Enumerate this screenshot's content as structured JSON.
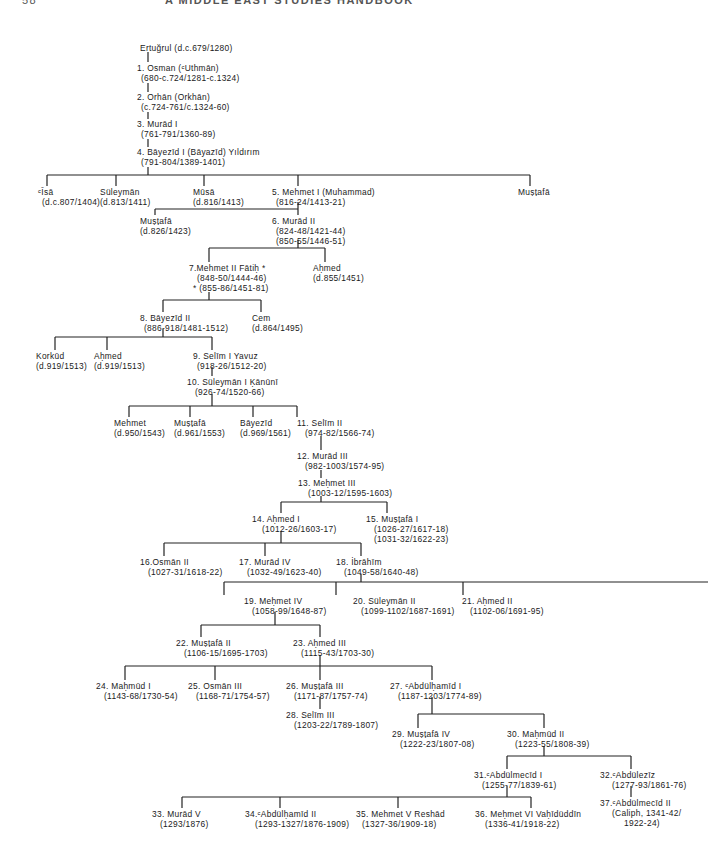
{
  "page": {
    "number": "58",
    "running_title": "A MIDDLE EAST STUDIES HANDBOOK"
  },
  "diagram_title": "Ottoman dynasty genealogy",
  "nodes": {
    "ertugrul": {
      "name": "Ertuğrul (d.c.679/1280)"
    },
    "n1": {
      "name": "1. Osman (ᶜUthmān)",
      "dates": "(680-c.724/1281-c.1324)"
    },
    "n2": {
      "name": "2. Orhān (Orkhān)",
      "dates": "(c.724-761/c.1324-60)"
    },
    "n3": {
      "name": "3. Murād I",
      "dates": "(761-791/1360-89)"
    },
    "n4": {
      "name": "4. Bāyezīd I (Bāyazīd) Yıldırım",
      "dates": "(791-804/1389-1401)"
    },
    "isa": {
      "name": "ᶜĪsā",
      "dates": "(d.c.807/1404)"
    },
    "suleyman_a": {
      "name": "Süleymān",
      "dates": "(d.813/1411)"
    },
    "musa": {
      "name": "Mūsā",
      "dates": "(d.816/1413)"
    },
    "n5": {
      "name": "5. Mehmet I (Muhammad)",
      "dates": "(816-24/1413-21)"
    },
    "mustafa_a": {
      "name": "Muṣṭafā"
    },
    "mustafa_b": {
      "name": "Muṣṭafā",
      "dates": "(d.826/1423)"
    },
    "n6": {
      "name": "6. Murād II",
      "dates": "(824-48/1421-44)",
      "dates2": "(850-55/1446-51)"
    },
    "n7": {
      "name": "7.Mehmet II Fātiḥ *",
      "dates": "(848-50/1444-46)",
      "dates2": "* (855-86/1451-81)"
    },
    "ahmed_a": {
      "name": "Aḥmed",
      "dates": "(d.855/1451)"
    },
    "n8": {
      "name": "8. Bāyezīd II",
      "dates": "(886-918/1481-1512)"
    },
    "cem": {
      "name": "Cem",
      "dates": "(d.864/1495)"
    },
    "korkud": {
      "name": "Korkūd",
      "dates": "(d.919/1513)"
    },
    "ahmed_b": {
      "name": "Aḥmed",
      "dates": "(d.919/1513)"
    },
    "n9": {
      "name": "9. Selīm I Yavuz",
      "dates": "(918-26/1512-20)"
    },
    "n10": {
      "name": "10. Süleymān I Ḳānūnī",
      "dates": "(926-74/1520-66)"
    },
    "mehmet_a": {
      "name": "Mehmet",
      "dates": "(d.950/1543)"
    },
    "mustafa_c": {
      "name": "Muṣṭafā",
      "dates": "(d.961/1553)"
    },
    "bayezid_a": {
      "name": "Bāyezīd",
      "dates": "(d.969/1561)"
    },
    "n11": {
      "name": "11. Selīm II",
      "dates": "(974-82/1566-74)"
    },
    "n12": {
      "name": "12. Murād III",
      "dates": "(982-1003/1574-95)"
    },
    "n13": {
      "name": "13. Meḥmet III",
      "dates": "(1003-12/1595-1603)"
    },
    "n14": {
      "name": "14. Aḥmed I",
      "dates": "(1012-26/1603-17)"
    },
    "n15": {
      "name": "15. Muṣṭafā I",
      "dates": "(1026-27/1617-18)",
      "dates2": "(1031-32/1622-23)"
    },
    "n16": {
      "name": "16.Osmān II",
      "dates": "(1027-31/1618-22)"
    },
    "n17": {
      "name": "17. Murād IV",
      "dates": "(1032-49/1623-40)"
    },
    "n18": {
      "name": "18. İbrāhīm",
      "dates": "(1049-58/1640-48)"
    },
    "n19": {
      "name": "19. Meḥmet IV",
      "dates": "(1058-99/1648-87)"
    },
    "n20": {
      "name": "20. Süleymān II",
      "dates": "(1099-1102/1687-1691)"
    },
    "n21": {
      "name": "21. Aḥmed II",
      "dates": "(1102-06/1691-95)"
    },
    "n22": {
      "name": "22. Muṣṭafā II",
      "dates": "(1106-15/1695-1703)"
    },
    "n23": {
      "name": "23. Aḥmed III",
      "dates": "(1115-43/1703-30)"
    },
    "n24": {
      "name": "24. Maḥmūd I",
      "dates": "(1143-68/1730-54)"
    },
    "n25": {
      "name": "25. Osmān III",
      "dates": "(1168-71/1754-57)"
    },
    "n26": {
      "name": "26. Muṣṭafā III",
      "dates": "(1171-87/1757-74)"
    },
    "n27": {
      "name": "27. ᶜAbdülḥamīd I",
      "dates": "(1187-1203/1774-89)"
    },
    "n28": {
      "name": "28. Selīm III",
      "dates": "(1203-22/1789-1807)"
    },
    "n29": {
      "name": "29. Muṣṭafā IV",
      "dates": "(1222-23/1807-08)"
    },
    "n30": {
      "name": "30. Maḥmūd II",
      "dates": "(1223-55/1808-39)"
    },
    "n31": {
      "name": "31.ᶜAbdülmecīd I",
      "dates": "(1255-77/1839-61)"
    },
    "n32": {
      "name": "32.ᶜAbdülezīz",
      "dates": "(1277-93/1861-76)"
    },
    "n33": {
      "name": "33. Murād V",
      "dates": "(1293/1876)"
    },
    "n34": {
      "name": "34.ᶜAbdülḥamīd II",
      "dates": "(1293-1327/1876-1909)"
    },
    "n35": {
      "name": "35. Mehmet V Reshād",
      "dates": "(1327-36/1909-18)"
    },
    "n36": {
      "name": "36. Meḥmet VI Vaḥīdüddīn",
      "dates": "(1336-41/1918-22)"
    },
    "n37": {
      "name": "37.ᶜAbdülmecīd II",
      "dates": "(Caliph, 1341-42/",
      "dates2": "1922-24)"
    }
  }
}
